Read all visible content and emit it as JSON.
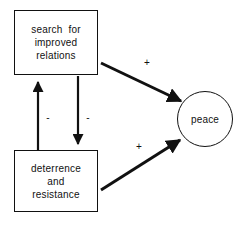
{
  "diagram": {
    "background_color": "#ffffff",
    "stroke_color": "#111111",
    "nodes": [
      {
        "id": "search",
        "shape": "rectangle",
        "lines": [
          "search  for",
          "improved",
          "relations"
        ]
      },
      {
        "id": "deterrence",
        "shape": "rectangle",
        "lines": [
          "deterrence",
          "and",
          "resistance"
        ]
      },
      {
        "id": "peace",
        "shape": "circle",
        "label": "peace"
      }
    ],
    "edges": [
      {
        "id": "search-to-peace",
        "from": "search",
        "to": "peace",
        "sign": "+",
        "direction": "down-right"
      },
      {
        "id": "deterrence-to-peace",
        "from": "deterrence",
        "to": "peace",
        "sign": "+",
        "direction": "up-right"
      },
      {
        "id": "search-to-deterrence",
        "from": "search",
        "to": "deterrence",
        "sign": "-",
        "direction": "down"
      },
      {
        "id": "deterrence-to-search",
        "from": "deterrence",
        "to": "search",
        "sign": "-",
        "direction": "up"
      }
    ],
    "labels": {
      "minus_left": "-",
      "minus_right": "-",
      "plus_upper": "+",
      "plus_lower": "+"
    }
  }
}
